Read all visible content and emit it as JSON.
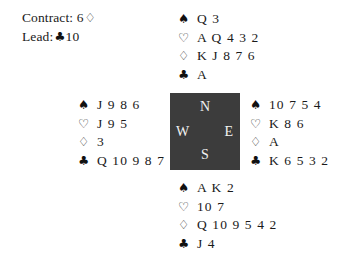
{
  "board": {
    "contract": {
      "label": "Contract:",
      "level": "6",
      "suit_symbol": "♢",
      "suit_name": "diamond-outline-icon"
    },
    "lead": {
      "label": "Lead:",
      "suit_symbol": "♣",
      "suit_name": "club-solid-icon",
      "card": "10"
    }
  },
  "compass": {
    "north": "N",
    "west": "W",
    "east": "E",
    "south": "S",
    "box_color": "#3c3c3c",
    "letter_color": "#f2f2f2"
  },
  "suit_symbols": {
    "spade": "♠",
    "heart": "♡",
    "diamond": "♢",
    "club": "♣"
  },
  "hands": {
    "north": {
      "seat": "North",
      "spades": "Q 3",
      "hearts": "A Q 4 3 2",
      "diamonds": "K J 8 7 6",
      "clubs": "A"
    },
    "west": {
      "seat": "West",
      "spades": "J 9 8 6",
      "hearts": "J 9 5",
      "diamonds": "3",
      "clubs": "Q 10 9 8 7"
    },
    "east": {
      "seat": "East",
      "spades": "10 7 5 4",
      "hearts": "K 8 6",
      "diamonds": "A",
      "clubs": "K 6 5 3 2"
    },
    "south": {
      "seat": "South",
      "spades": "A K 2",
      "hearts": "10 7",
      "diamonds": "Q 10 9 5 4 2",
      "clubs": "J 4"
    }
  }
}
